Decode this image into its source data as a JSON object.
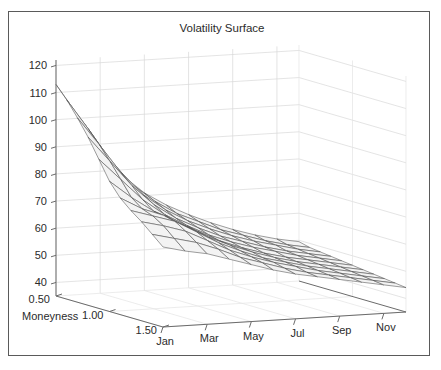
{
  "figure": {
    "title": "Volatility Surface",
    "background_color": "#ffffff",
    "border_color": "#5a5a5a"
  },
  "chart_data": {
    "type": "surface",
    "title": "Volatility Surface",
    "xlabel": "",
    "ylabel": "Moneyness",
    "zlabel": "",
    "projection": "3d",
    "grid": true,
    "legend": null,
    "surface_color": "#f2f2f2",
    "mesh_color": "#4d4d4d",
    "x": {
      "name": "month",
      "tick_labels": [
        "Jan",
        "Mar",
        "May",
        "Jul",
        "Sep",
        "Nov"
      ],
      "tick_values": [
        1,
        3,
        5,
        7,
        9,
        11
      ],
      "values": [
        1,
        2,
        3,
        4,
        5,
        6,
        7,
        8,
        9,
        10,
        11,
        12
      ],
      "lim": [
        1,
        12
      ]
    },
    "y": {
      "name": "moneyness",
      "tick_labels": [
        "0.50",
        "1.00",
        "1.50"
      ],
      "tick_values": [
        0.5,
        1.0,
        1.5
      ],
      "values": [
        0.5,
        0.6,
        0.7,
        0.8,
        0.9,
        1.0,
        1.1,
        1.2,
        1.3,
        1.4,
        1.5
      ],
      "lim": [
        0.5,
        1.5
      ]
    },
    "z": {
      "name": "implied_volatility",
      "tick_labels": [
        "40",
        "50",
        "60",
        "70",
        "80",
        "90",
        "100",
        "110",
        "120"
      ],
      "tick_values": [
        40,
        50,
        60,
        70,
        80,
        90,
        100,
        110,
        120
      ],
      "lim": [
        35,
        122
      ]
    },
    "values": [
      [
        113.0,
        101.0,
        88.0,
        78.0,
        71.0,
        66.0,
        62.0,
        58.5,
        55.5,
        53.0,
        51.0,
        49.5
      ],
      [
        108.5,
        97.0,
        85.0,
        75.5,
        69.0,
        64.0,
        60.5,
        57.0,
        54.5,
        52.0,
        50.0,
        48.5
      ],
      [
        103.0,
        92.5,
        81.5,
        73.0,
        67.0,
        62.5,
        59.0,
        56.0,
        53.5,
        51.5,
        49.5,
        48.0
      ],
      [
        97.0,
        87.5,
        78.0,
        70.5,
        65.0,
        61.0,
        57.5,
        55.0,
        52.5,
        50.5,
        49.0,
        47.5
      ],
      [
        90.0,
        82.0,
        74.0,
        68.0,
        63.5,
        59.5,
        56.5,
        54.0,
        52.0,
        50.0,
        48.5,
        47.0
      ],
      [
        83.0,
        76.5,
        71.0,
        66.5,
        62.5,
        58.5,
        55.5,
        53.0,
        51.0,
        49.5,
        48.0,
        46.5
      ],
      [
        78.0,
        73.5,
        70.5,
        66.0,
        61.5,
        58.0,
        55.0,
        52.5,
        50.5,
        49.0,
        47.5,
        46.0
      ],
      [
        74.5,
        72.0,
        69.5,
        65.0,
        60.5,
        57.0,
        54.0,
        52.0,
        50.0,
        48.5,
        47.0,
        45.5
      ],
      [
        71.5,
        69.5,
        67.0,
        63.0,
        59.0,
        56.0,
        53.5,
        51.5,
        49.5,
        48.0,
        46.5,
        45.0
      ],
      [
        68.0,
        66.0,
        64.0,
        61.0,
        57.5,
        55.0,
        52.5,
        50.5,
        49.0,
        47.5,
        46.0,
        44.5
      ],
      [
        64.5,
        62.5,
        61.0,
        58.5,
        56.0,
        53.5,
        51.5,
        50.0,
        48.5,
        47.0,
        45.5,
        44.0
      ]
    ]
  },
  "axes": {
    "z_ticks": [
      "120",
      "110",
      "100",
      "90",
      "80",
      "70",
      "60",
      "50",
      "40"
    ],
    "y_ticks": [
      "0.50",
      "1.00",
      "1.50"
    ],
    "y_axis_label": "Moneyness",
    "x_ticks": [
      "Jan",
      "Mar",
      "May",
      "Jul",
      "Sep",
      "Nov"
    ]
  }
}
